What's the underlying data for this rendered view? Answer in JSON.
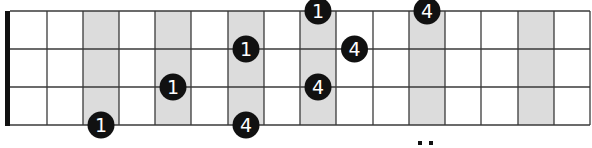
{
  "fretboard": {
    "strings_shown": 4,
    "frets_shown": 16,
    "nut": true,
    "string_y": [
      11,
      49,
      87,
      125
    ],
    "fret_x": [
      10,
      47,
      83,
      119,
      155,
      191,
      228,
      264,
      300,
      336,
      373,
      409,
      445,
      481,
      518,
      554,
      590
    ],
    "shaded_frets": [
      3,
      5,
      7,
      9,
      12,
      15
    ],
    "colors": {
      "line": "#3a3a3a",
      "shade": "#dcdcdc",
      "dot": "#111111",
      "dot_text": "#ffffff",
      "nut": "#111111"
    },
    "notes": [
      {
        "string": 4,
        "fret": 3,
        "finger": "1"
      },
      {
        "string": 3,
        "fret": 5,
        "finger": "1"
      },
      {
        "string": 2,
        "fret": 7,
        "finger": "1"
      },
      {
        "string": 1,
        "fret": 9,
        "finger": "1"
      },
      {
        "string": 4,
        "fret": 7,
        "finger": "4"
      },
      {
        "string": 3,
        "fret": 9,
        "finger": "4"
      },
      {
        "string": 2,
        "fret": 10,
        "finger": "4"
      },
      {
        "string": 1,
        "fret": 12,
        "finger": "4"
      }
    ],
    "marker_double_dot_fret": 12
  }
}
